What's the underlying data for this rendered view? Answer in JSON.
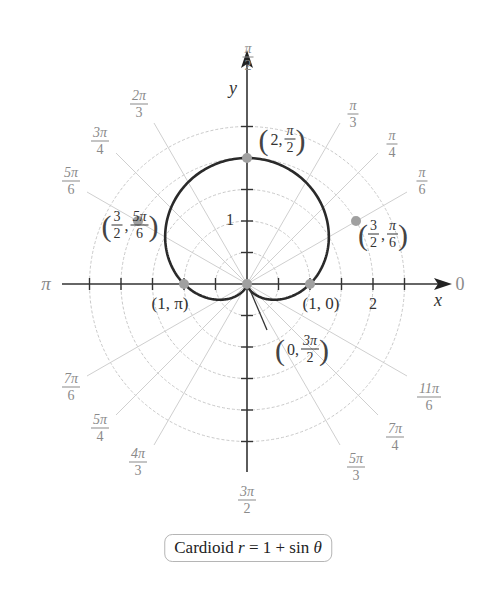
{
  "chart_data": {
    "type": "line",
    "coordinate_system": "polar",
    "title": "Cardioid r = 1 + sin θ",
    "equation": "r = 1 + sin θ",
    "xlabel": "x",
    "ylabel": "y",
    "radial_grid": [
      0.5,
      1,
      1.5,
      2,
      2.5
    ],
    "radial_tick_labels": [
      "1",
      "2"
    ],
    "angle_labels": [
      "0",
      "π/6",
      "π/4",
      "π/3",
      "π/2",
      "2π/3",
      "3π/4",
      "5π/6",
      "π",
      "7π/6",
      "5π/4",
      "4π/3",
      "3π/2",
      "5π/3",
      "7π/4",
      "11π/6"
    ],
    "series": [
      {
        "name": "Cardioid r = 1 + sin θ",
        "theta_deg": [
          0,
          30,
          60,
          90,
          120,
          150,
          180,
          210,
          240,
          270,
          300,
          330,
          360
        ],
        "r": [
          1,
          1.5,
          1.866,
          2,
          1.866,
          1.5,
          1,
          0.5,
          0.134,
          0,
          0.134,
          0.5,
          1
        ]
      }
    ],
    "highlighted_points": [
      {
        "label": "(2, π/2)",
        "r": 2,
        "theta": "π/2"
      },
      {
        "label": "(3/2, π/6)",
        "r": 1.5,
        "theta": "π/6"
      },
      {
        "label": "(3/2, 5π/6)",
        "r": 1.5,
        "theta": "5π/6"
      },
      {
        "label": "(1, 0)",
        "r": 1,
        "theta": "0"
      },
      {
        "label": "(1, π)",
        "r": 1,
        "theta": "π"
      },
      {
        "label": "(0, 3π/2)",
        "r": 0,
        "theta": "3π/2"
      }
    ],
    "grid": true
  },
  "labels": {
    "x_axis": "x",
    "y_axis": "y",
    "tick_1": "1",
    "tick_2": "2",
    "angle_0": "0",
    "angle_pi": "π",
    "pi6": {
      "num": "π",
      "den": "6"
    },
    "pi4": {
      "num": "π",
      "den": "4"
    },
    "pi3": {
      "num": "π",
      "den": "3"
    },
    "pi2": {
      "num": "π",
      "den": "2"
    },
    "twopi3": {
      "num": "2π",
      "den": "3"
    },
    "threepi4": {
      "num": "3π",
      "den": "4"
    },
    "fivepi6": {
      "num": "5π",
      "den": "6"
    },
    "sevenpi6": {
      "num": "7π",
      "den": "6"
    },
    "fivepi4": {
      "num": "5π",
      "den": "4"
    },
    "fourpi3": {
      "num": "4π",
      "den": "3"
    },
    "threepi2": {
      "num": "3π",
      "den": "2"
    },
    "fivepi3": {
      "num": "5π",
      "den": "3"
    },
    "sevenpi4": {
      "num": "7π",
      "den": "4"
    },
    "elevenpi6": {
      "num": "11π",
      "den": "6"
    }
  },
  "points": {
    "p_top": {
      "r": "2,",
      "num": "π",
      "den": "2"
    },
    "p_right": {
      "rnum": "3",
      "rden": "2",
      "num": "π",
      "den": "6"
    },
    "p_left": {
      "rnum": "3",
      "rden": "2",
      "num": "5π",
      "den": "6"
    },
    "p_one_zero": "(1, 0)",
    "p_one_pi": "(1, π)",
    "p_origin": {
      "r": "0,",
      "num": "3π",
      "den": "2"
    }
  },
  "caption": {
    "prefix": "Cardioid ",
    "var": "r",
    "rest": " = 1 + sin ",
    "theta": "θ"
  },
  "colors": {
    "curve": "#2a2a2a",
    "grid": "#c8c8c8",
    "axis": "#333333",
    "point": "#9a9a9a",
    "angle_label": "#8a8a8a"
  }
}
